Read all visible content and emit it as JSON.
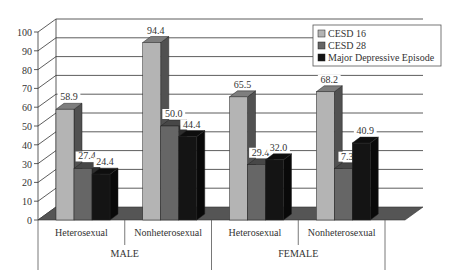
{
  "chart_data": {
    "type": "bar",
    "style": "3d-clustered",
    "title": "",
    "xlabel": "",
    "ylabel": "",
    "ylim": [
      0,
      100
    ],
    "yticks": [
      0,
      10,
      20,
      30,
      40,
      50,
      60,
      70,
      80,
      90,
      100
    ],
    "grid": true,
    "legend_position": "top-right",
    "groups": [
      {
        "label": "MALE",
        "categories": [
          "Heterosexual",
          "Nonheterosexual"
        ]
      },
      {
        "label": "FEMALE",
        "categories": [
          "Heterosexual",
          "Nonheterosexual"
        ]
      }
    ],
    "categories": [
      "Heterosexual",
      "Nonheterosexual",
      "Heterosexual",
      "Nonheterosexual"
    ],
    "series": [
      {
        "name": "CESD 16",
        "color": "#b4b4b4",
        "values": [
          58.9,
          94.4,
          65.5,
          68.2
        ],
        "labels": [
          "58.9",
          "94.4",
          "65.5",
          "68.2"
        ]
      },
      {
        "name": "CESD 28",
        "color": "#666666",
        "values": [
          27.4,
          50.0,
          29.4,
          27.3
        ],
        "labels": [
          "27.4",
          "50.0",
          "29.4",
          "7.3"
        ]
      },
      {
        "name": "Major Depressive Episode",
        "color": "#141414",
        "values": [
          24.4,
          44.4,
          32.0,
          40.9
        ],
        "labels": [
          "24.4",
          "44.4",
          "32.0",
          "40.9"
        ]
      }
    ]
  }
}
